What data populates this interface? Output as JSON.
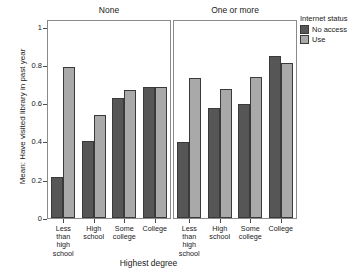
{
  "chart_data": {
    "type": "bar",
    "title": "",
    "xlabel": "Highest degree",
    "ylabel": "Mean: Have visited library in past year",
    "ylim": [
      0,
      1.04
    ],
    "yticks": [
      0,
      0.2,
      0.4,
      0.6,
      0.8,
      1
    ],
    "ytick_labels": [
      "0",
      "0.2",
      "0.4",
      "0.6",
      "0.8",
      "1"
    ],
    "grid": false,
    "legend": {
      "title": "Internet status",
      "position": "right",
      "entries": [
        {
          "name": "No access",
          "color": "#565656"
        },
        {
          "name": "Use",
          "color": "#a9a9a9"
        }
      ]
    },
    "facet_variable": "Number of children",
    "panels": [
      {
        "title": "None",
        "categories": [
          "Less than high school",
          "High school",
          "Some college",
          "College"
        ],
        "series": [
          {
            "name": "No access",
            "values": [
              0.215,
              0.4,
              0.625,
              0.685
            ]
          },
          {
            "name": "Use",
            "values": [
              0.79,
              0.54,
              0.67,
              0.685
            ]
          }
        ]
      },
      {
        "title": "One or more",
        "categories": [
          "Less than high school",
          "High school",
          "Some college",
          "College"
        ],
        "series": [
          {
            "name": "No access",
            "values": [
              0.395,
              0.575,
              0.595,
              0.845
            ]
          },
          {
            "name": "Use",
            "values": [
              0.73,
              0.675,
              0.735,
              0.81
            ]
          }
        ]
      }
    ],
    "category_label_lines": [
      [
        "Less",
        "than",
        "high",
        "school"
      ],
      [
        "High",
        "school"
      ],
      [
        "Some",
        "college"
      ],
      [
        "College"
      ]
    ]
  }
}
